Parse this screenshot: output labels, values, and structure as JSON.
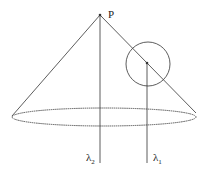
{
  "diagram": {
    "apex_label": "P",
    "lines": [
      {
        "symbol": "λ",
        "subscript": "2"
      },
      {
        "symbol": "λ",
        "subscript": "1"
      }
    ],
    "stroke_color": "#333333"
  }
}
